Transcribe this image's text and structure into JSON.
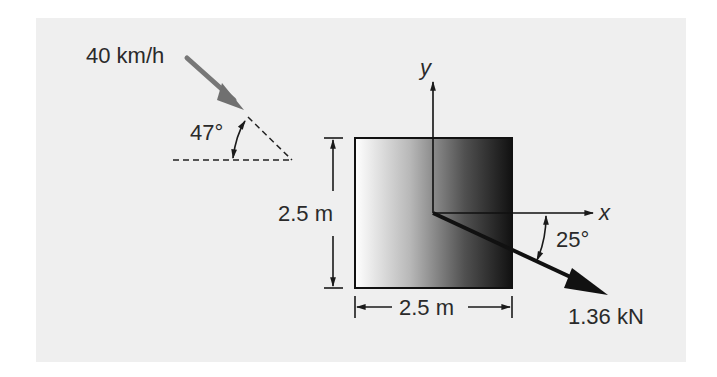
{
  "figure": {
    "background_color": "#efefef",
    "wind": {
      "speed_label": "40 km/h",
      "angle_label": "47°",
      "angle_deg": 47,
      "arrow_color": "#777777"
    },
    "plate": {
      "height_label": "2.5 m",
      "width_label": "2.5 m",
      "gradient_light": "#ffffff",
      "gradient_dark": "#111111"
    },
    "axes": {
      "x_label": "x",
      "y_label": "y"
    },
    "force": {
      "magnitude_label": "1.36 kN",
      "angle_label": "25°",
      "angle_deg": 25
    }
  }
}
